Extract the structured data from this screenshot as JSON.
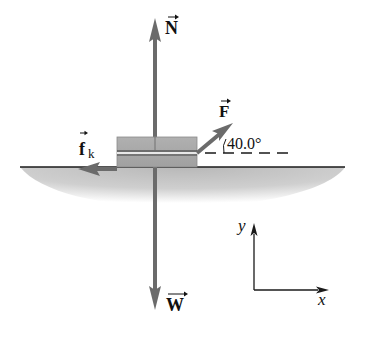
{
  "diagram": {
    "type": "free-body-diagram",
    "forces": {
      "normal": {
        "symbol": "N",
        "direction": "up"
      },
      "applied": {
        "symbol": "F",
        "angle_label": "40.0°",
        "direction": "up-right"
      },
      "friction": {
        "symbol": "f",
        "subscript": "k",
        "direction": "left"
      },
      "weight": {
        "symbol": "W",
        "direction": "down"
      }
    },
    "axes": {
      "x_label": "x",
      "y_label": "y"
    },
    "colors": {
      "arrow": "#6b6b6b",
      "block": "#a9a9a9",
      "ground": "#c8c8c8",
      "line": "#1a1a1a"
    }
  }
}
